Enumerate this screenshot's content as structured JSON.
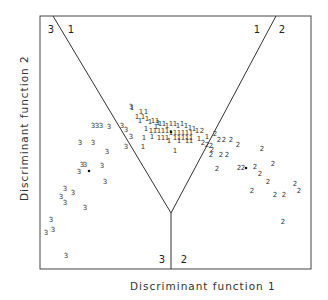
{
  "chart_data": {
    "type": "scatter",
    "subtype": "territorial-map",
    "title": "",
    "xlabel": "Discriminant function 1",
    "ylabel": "Discriminant function 2",
    "grid": false,
    "legend": null,
    "frame": {
      "x0": 40,
      "y0": 16,
      "x1": 311,
      "y1": 269
    },
    "boundaries": [
      {
        "name": "boundary-3-1",
        "from": [
          53,
          16
        ],
        "to": [
          171,
          213
        ]
      },
      {
        "name": "boundary-1-2",
        "from": [
          276,
          16
        ],
        "to": [
          171,
          213
        ]
      },
      {
        "name": "boundary-3-2",
        "from": [
          171,
          213
        ],
        "to": [
          171,
          269
        ]
      }
    ],
    "region_labels": [
      {
        "text": "3",
        "x": 51,
        "y": 33
      },
      {
        "text": "1",
        "x": 71,
        "y": 33
      },
      {
        "text": "1",
        "x": 257,
        "y": 33
      },
      {
        "text": "2",
        "x": 282,
        "y": 33
      },
      {
        "text": "3",
        "x": 162,
        "y": 263
      },
      {
        "text": "2",
        "x": 184,
        "y": 263
      }
    ],
    "centroids": [
      {
        "group": "1",
        "x": 171,
        "y": 132
      },
      {
        "group": "2",
        "x": 246,
        "y": 168
      },
      {
        "group": "3",
        "x": 89,
        "y": 171
      }
    ],
    "series": [
      {
        "name": "1",
        "points": [
          [
            132,
            108
          ],
          [
            141,
            112
          ],
          [
            146,
            112
          ],
          [
            137,
            117
          ],
          [
            143,
            117
          ],
          [
            140,
            121
          ],
          [
            147,
            119
          ],
          [
            150,
            122
          ],
          [
            153,
            121
          ],
          [
            157,
            121
          ],
          [
            158,
            123
          ],
          [
            156,
            127
          ],
          [
            160,
            124
          ],
          [
            164,
            124
          ],
          [
            167,
            126
          ],
          [
            171,
            124
          ],
          [
            175,
            124
          ],
          [
            178,
            126
          ],
          [
            182,
            124
          ],
          [
            186,
            126
          ],
          [
            190,
            128
          ],
          [
            194,
            129
          ],
          [
            146,
            129
          ],
          [
            151,
            131
          ],
          [
            155,
            131
          ],
          [
            159,
            131
          ],
          [
            163,
            131
          ],
          [
            167,
            131
          ],
          [
            171,
            133
          ],
          [
            175,
            133
          ],
          [
            179,
            133
          ],
          [
            183,
            133
          ],
          [
            187,
            133
          ],
          [
            191,
            133
          ],
          [
            144,
            138
          ],
          [
            152,
            137
          ],
          [
            159,
            138
          ],
          [
            163,
            138
          ],
          [
            167,
            138
          ],
          [
            175,
            138
          ],
          [
            179,
            138
          ],
          [
            183,
            138
          ],
          [
            187,
            138
          ],
          [
            191,
            138
          ],
          [
            169,
            141
          ],
          [
            179,
            141
          ],
          [
            187,
            141
          ],
          [
            191,
            141
          ],
          [
            143,
            147
          ],
          [
            175,
            151
          ],
          [
            197,
            131
          ],
          [
            207,
            137
          ],
          [
            199,
            139
          ]
        ]
      },
      {
        "name": "2",
        "points": [
          [
            202,
            131
          ],
          [
            215,
            134
          ],
          [
            219,
            140
          ],
          [
            224,
            140
          ],
          [
            231,
            140
          ],
          [
            238,
            145
          ],
          [
            203,
            143
          ],
          [
            207,
            145
          ],
          [
            211,
            146
          ],
          [
            212,
            150
          ],
          [
            211,
            155
          ],
          [
            221,
            155
          ],
          [
            227,
            155
          ],
          [
            262,
            149
          ],
          [
            217,
            169
          ],
          [
            239,
            168
          ],
          [
            243,
            168
          ],
          [
            255,
            167
          ],
          [
            260,
            174
          ],
          [
            273,
            164
          ],
          [
            268,
            182
          ],
          [
            252,
            191
          ],
          [
            275,
            195
          ],
          [
            284,
            195
          ],
          [
            295,
            184
          ],
          [
            299,
            191
          ],
          [
            283,
            222
          ]
        ]
      },
      {
        "name": "3",
        "points": [
          [
            131,
            107
          ],
          [
            122,
            126
          ],
          [
            109,
            127
          ],
          [
            126,
            130
          ],
          [
            131,
            137
          ],
          [
            93,
            126
          ],
          [
            97,
            126
          ],
          [
            101,
            126
          ],
          [
            80,
            143
          ],
          [
            93,
            143
          ],
          [
            126,
            147
          ],
          [
            107,
            152
          ],
          [
            82,
            165
          ],
          [
            85,
            165
          ],
          [
            79,
            172
          ],
          [
            102,
            166
          ],
          [
            105,
            182
          ],
          [
            65,
            189
          ],
          [
            73,
            193
          ],
          [
            61,
            197
          ],
          [
            65,
            203
          ],
          [
            85,
            208
          ],
          [
            51,
            220
          ],
          [
            53,
            230
          ],
          [
            46,
            233
          ],
          [
            66,
            256
          ]
        ]
      }
    ]
  }
}
